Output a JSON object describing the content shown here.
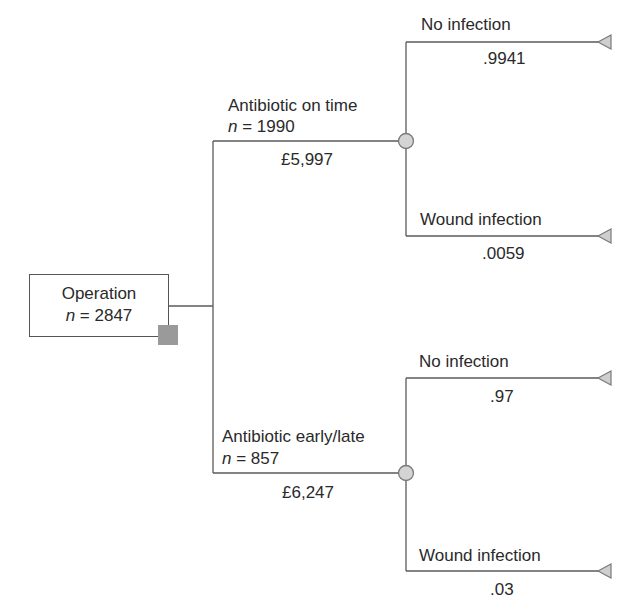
{
  "root": {
    "label": "Operation",
    "n_prefix": "n",
    "n_value": "= 2847",
    "node_type": "decision"
  },
  "branches": [
    {
      "label": "Antibiotic on time",
      "n_prefix": "n",
      "n_value": "= 1990",
      "cost": "£5,997",
      "node_type": "chance",
      "outcomes": [
        {
          "label": "No infection",
          "probability": ".9941",
          "node_type": "terminal"
        },
        {
          "label": "Wound infection",
          "probability": ".0059",
          "node_type": "terminal"
        }
      ]
    },
    {
      "label": "Antibiotic early/late",
      "n_prefix": "n",
      "n_value": "= 857",
      "cost": "£6,247",
      "node_type": "chance",
      "outcomes": [
        {
          "label": "No infection",
          "probability": ".97",
          "node_type": "terminal"
        },
        {
          "label": "Wound infection",
          "probability": ".03",
          "node_type": "terminal"
        }
      ]
    }
  ],
  "colors": {
    "line": "#5a5a5a",
    "decision_node": "#9a9a9a",
    "chance_node": "#d4d4d4",
    "terminal_node": "#cfcfcf"
  }
}
